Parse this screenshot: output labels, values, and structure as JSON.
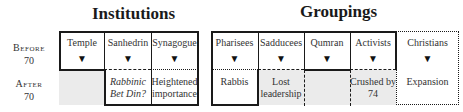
{
  "titles": {
    "institutions": "Institutions",
    "groupings": "Groupings"
  },
  "row_labels": {
    "before": {
      "word": "Before",
      "year": "70"
    },
    "after": {
      "word": "After",
      "year": "70"
    }
  },
  "institutions": [
    {
      "before": "Temple",
      "arrow": "▼",
      "after": ""
    },
    {
      "before": "Sanhedrin",
      "arrow": "▼",
      "after_line1": "Rabbinic",
      "after_line2": "Bet Din?"
    },
    {
      "before": "Synagogue",
      "arrow": "▼",
      "after_line1": "Heightened",
      "after_line2": "importance"
    }
  ],
  "groupings": [
    {
      "before": "Pharisees",
      "arrow": "▼",
      "after_line1": "Rabbis",
      "after_line2": ""
    },
    {
      "before": "Sadducees",
      "arrow": "▼",
      "after_line1": "Lost",
      "after_line2": "leadership"
    },
    {
      "before": "Qumran",
      "arrow": "▼",
      "after_line1": "",
      "after_line2": ""
    },
    {
      "before": "Activists",
      "arrow": "▼",
      "after_line1": "Crushed by",
      "after_line2": "74"
    },
    {
      "before": "Christians",
      "arrow": "▼",
      "after_line1": "Expansion",
      "after_line2": ""
    }
  ],
  "colors": {
    "line": "#1a1a1a",
    "shade": "#ebebeb"
  }
}
